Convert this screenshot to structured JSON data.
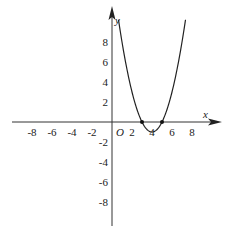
{
  "chart_data": {
    "type": "line",
    "title": "",
    "function": "y = x^2 - 8x + 15",
    "xlabel": "x",
    "ylabel": "y",
    "origin_label": "O",
    "xlim": [
      -10,
      10
    ],
    "ylim": [
      -10,
      10
    ],
    "x_ticks": [
      -8,
      -6,
      -4,
      -2,
      2,
      4,
      6,
      8
    ],
    "y_ticks": [
      -8,
      -6,
      -4,
      -2,
      2,
      4,
      6,
      8
    ],
    "grid": false,
    "series": [
      {
        "name": "parabola",
        "x": [
          0.5,
          1,
          1.5,
          2,
          2.5,
          3,
          3.5,
          4,
          4.5,
          5,
          5.5,
          6,
          6.5,
          7,
          7.5
        ],
        "y": [
          11.25,
          8,
          5.25,
          3,
          1.25,
          0,
          -0.75,
          -1,
          -0.75,
          0,
          1.25,
          3,
          5.25,
          8,
          11.25
        ]
      }
    ],
    "marked_points": [
      {
        "x": 3,
        "y": 0
      },
      {
        "x": 5,
        "y": 0
      }
    ],
    "vertex": {
      "x": 4,
      "y": -1
    }
  }
}
